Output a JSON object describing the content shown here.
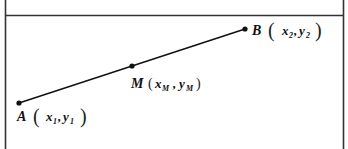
{
  "diagram": {
    "type": "line-segment-midpoint",
    "points": [
      {
        "id": "A",
        "name": "A",
        "x_var": "x",
        "x_sub": "1",
        "y_var": "y",
        "y_sub": "1",
        "px": 19,
        "py": 103
      },
      {
        "id": "M",
        "name": "M",
        "x_var": "x",
        "x_sub": "M",
        "y_var": "y",
        "y_sub": "M",
        "px": 132,
        "py": 66
      },
      {
        "id": "B",
        "name": "B",
        "x_var": "x",
        "x_sub": "2",
        "y_var": "y",
        "y_sub": "2",
        "px": 245,
        "py": 29
      }
    ],
    "labels": {
      "A": {
        "name": "A",
        "x": "x",
        "x_sub": "1",
        "y": "y",
        "y_sub": "1"
      },
      "M": {
        "name": "M",
        "x": "x",
        "x_sub": "M",
        "y": "y",
        "y_sub": "M"
      },
      "B": {
        "name": "B",
        "x": "x",
        "x_sub": "2",
        "y": "y",
        "y_sub": "2"
      }
    },
    "punct": {
      "open": "(",
      "close": ")",
      "comma": ","
    },
    "colors": {
      "line": "#111111",
      "frame": "#333333"
    }
  }
}
